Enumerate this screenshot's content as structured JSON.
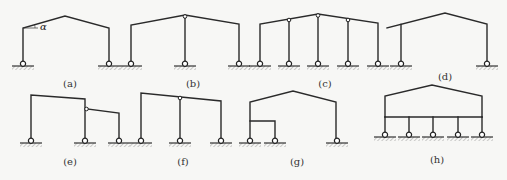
{
  "figure": {
    "panels": [
      {
        "id": "a",
        "label": "(a)",
        "angle_symbol": "α",
        "type": "single-span gabled portal frame"
      },
      {
        "id": "b",
        "label": "(b)",
        "type": "two-span gabled frame with hinged center column"
      },
      {
        "id": "c",
        "label": "(c)",
        "type": "four-span gabled frame with hinged interior columns"
      },
      {
        "id": "d",
        "label": "(d)",
        "type": "single-span gabled frame with overhanging eave"
      },
      {
        "id": "e",
        "label": "(e)",
        "type": "two-span stepped frame with hinged lower span"
      },
      {
        "id": "f",
        "label": "(f)",
        "type": "two-span mono-slope frame with hinged center column"
      },
      {
        "id": "g",
        "label": "(g)",
        "type": "gabled frame with internal lean-to"
      },
      {
        "id": "h",
        "label": "(h)",
        "type": "gabled frame on multi-column base beam"
      }
    ]
  }
}
